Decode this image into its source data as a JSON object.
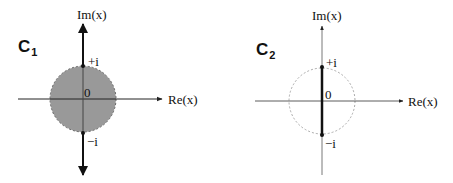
{
  "diagrams": [
    {
      "label": "C",
      "subscript": "1",
      "x_axis_label": "Re(x)",
      "y_axis_label": "Im(x)",
      "origin_label": "0",
      "top_point_label": "+i",
      "bottom_point_label": "−i",
      "description": "Shaded unit disk with branch cuts along the imaginary axis from +i to +i∞ and from −i to −i∞",
      "fill_color": "#999999"
    },
    {
      "label": "C",
      "subscript": "2",
      "x_axis_label": "Re(x)",
      "y_axis_label": "Im(x)",
      "origin_label": "0",
      "top_point_label": "+i",
      "bottom_point_label": "−i",
      "description": "Dashed unit circle with branch cut on the imaginary axis from −i to +i",
      "circle_color": "#aaaaaa"
    }
  ]
}
